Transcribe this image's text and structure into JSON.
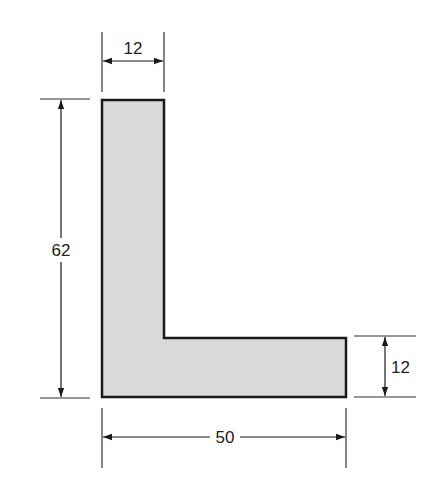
{
  "diagram": {
    "type": "L-shaped cross-section with dimensions",
    "shape": {
      "fill": "#d9d9d9",
      "stroke": "#1a1a1a",
      "points_px": [
        [
          102,
          100
        ],
        [
          164,
          100
        ],
        [
          164,
          338
        ],
        [
          346,
          338
        ],
        [
          346,
          397
        ],
        [
          102,
          397
        ]
      ]
    },
    "dimensions": {
      "top_width": {
        "label": "12"
      },
      "overall_height": {
        "label": "62"
      },
      "flange_thickness": {
        "label": "12"
      },
      "overall_width": {
        "label": "50"
      }
    },
    "line_color": "#333333"
  }
}
